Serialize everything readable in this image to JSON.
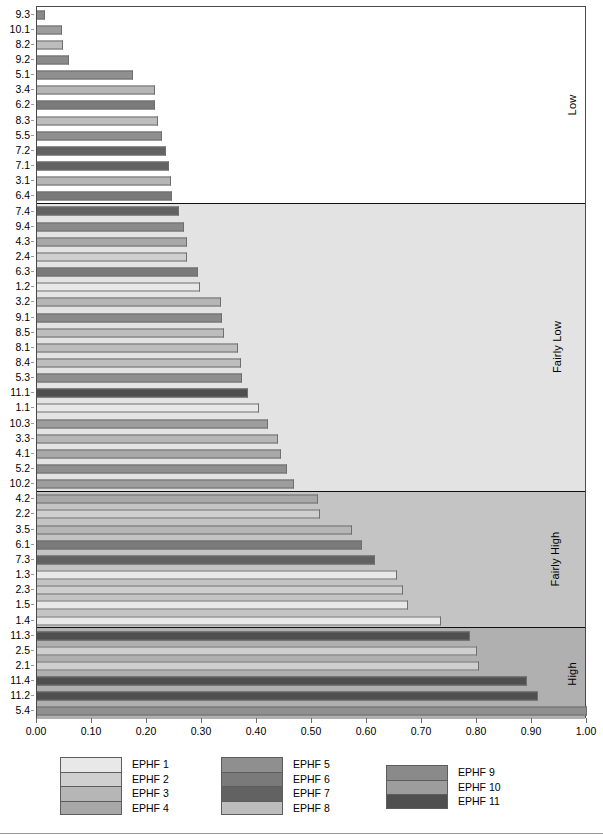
{
  "chart_data": {
    "type": "bar",
    "orientation": "horizontal",
    "title": "",
    "xlabel": "",
    "ylabel": "",
    "xlim": [
      0.0,
      1.0
    ],
    "xticks": [
      "0.00",
      "0.10",
      "0.20",
      "0.30",
      "0.40",
      "0.50",
      "0.60",
      "0.70",
      "0.80",
      "0.90",
      "1.00"
    ],
    "xtick_values": [
      0.0,
      0.1,
      0.2,
      0.3,
      0.4,
      0.5,
      0.6,
      0.7,
      0.8,
      0.9,
      1.0
    ],
    "grid": false,
    "legend_position": "bottom",
    "categories": [
      "9.3",
      "10.1",
      "8.2",
      "9.2",
      "5.1",
      "3.4",
      "6.2",
      "8.3",
      "5.5",
      "7.2",
      "7.1",
      "3.1",
      "6.4",
      "7.4",
      "9.4",
      "4.3",
      "2.4",
      "6.3",
      "1.2",
      "3.2",
      "9.1",
      "8.5",
      "8.1",
      "8.4",
      "5.3",
      "11.1",
      "1.1",
      "10.3",
      "3.3",
      "4.1",
      "5.2",
      "10.2",
      "4.2",
      "2.2",
      "3.5",
      "6.1",
      "7.3",
      "1.3",
      "2.3",
      "1.5",
      "1.4",
      "11.3",
      "2.5",
      "2.1",
      "11.4",
      "11.2",
      "5.4"
    ],
    "values": [
      0.015,
      0.045,
      0.048,
      0.058,
      0.175,
      0.215,
      0.215,
      0.22,
      0.228,
      0.235,
      0.24,
      0.243,
      0.245,
      0.258,
      0.268,
      0.272,
      0.272,
      0.292,
      0.297,
      0.335,
      0.337,
      0.34,
      0.365,
      0.37,
      0.372,
      0.383,
      0.403,
      0.42,
      0.438,
      0.443,
      0.455,
      0.468,
      0.51,
      0.515,
      0.573,
      0.59,
      0.615,
      0.655,
      0.665,
      0.675,
      0.735,
      0.788,
      0.8,
      0.803,
      0.89,
      0.91,
      1.0
    ],
    "series_key": [
      9,
      10,
      8,
      9,
      5,
      3,
      6,
      8,
      5,
      7,
      7,
      3,
      6,
      7,
      9,
      4,
      2,
      6,
      1,
      3,
      9,
      8,
      8,
      8,
      5,
      11,
      1,
      10,
      3,
      4,
      5,
      10,
      4,
      2,
      3,
      6,
      7,
      1,
      2,
      1,
      1,
      11,
      2,
      2,
      11,
      11,
      5
    ]
  },
  "bands": [
    {
      "label": "Low",
      "color": "#ffffff",
      "start_index": 0,
      "end_index": 12
    },
    {
      "label": "Fairly Low",
      "color": "#e3e3e3",
      "start_index": 13,
      "end_index": 31
    },
    {
      "label": "Fairly High",
      "color": "#c4c4c4",
      "start_index": 32,
      "end_index": 40
    },
    {
      "label": "High",
      "color": "#b0b0b0",
      "start_index": 41,
      "end_index": 46
    }
  ],
  "legend": {
    "groups": [
      {
        "items": [
          {
            "label": "EPHF 1",
            "key": 1,
            "color": "#e8e8e8"
          },
          {
            "label": "EPHF 2",
            "key": 2,
            "color": "#cfcfcf"
          },
          {
            "label": "EPHF 3",
            "key": 3,
            "color": "#b6b6b6"
          },
          {
            "label": "EPHF 4",
            "key": 4,
            "color": "#a8a8a8"
          }
        ]
      },
      {
        "items": [
          {
            "label": "EPHF 5",
            "key": 5,
            "color": "#8f8f8f"
          },
          {
            "label": "EPHF 6",
            "key": 6,
            "color": "#7a7a7a"
          },
          {
            "label": "EPHF 7",
            "key": 7,
            "color": "#626262"
          },
          {
            "label": "EPHF 8",
            "key": 8,
            "color": "#bdbdbd"
          }
        ]
      },
      {
        "items": [
          {
            "label": "EPHF 9",
            "key": 9,
            "color": "#8a8a8a"
          },
          {
            "label": "EPHF 10",
            "key": 10,
            "color": "#9d9d9d"
          },
          {
            "label": "EPHF 11",
            "key": 11,
            "color": "#4f4f4f"
          }
        ]
      }
    ]
  },
  "colors": {
    "1": "#e8e8e8",
    "2": "#cfcfcf",
    "3": "#b6b6b6",
    "4": "#a8a8a8",
    "5": "#8f8f8f",
    "6": "#7a7a7a",
    "7": "#626262",
    "8": "#bdbdbd",
    "9": "#8a8a8a",
    "10": "#9d9d9d",
    "11": "#4f4f4f",
    "axis": "#4a4a4a",
    "bar_border": "#6f6f6f"
  }
}
